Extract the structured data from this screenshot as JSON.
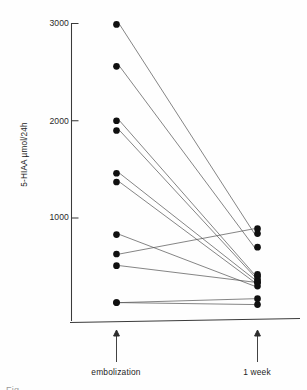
{
  "figure": {
    "kind": "paired-slope-scatter",
    "caption_fragment": "Fig."
  },
  "axes": {
    "y_title": "5-HIAA µmol/24h",
    "y_ticks": [
      {
        "label": "3000",
        "value": 3000
      },
      {
        "label": "2000",
        "value": 2000
      },
      {
        "label": "1000",
        "value": 1000
      }
    ],
    "categories": [
      {
        "label": "embolization",
        "arrow": "arrow-up-icon"
      },
      {
        "label": "1 week",
        "arrow": "arrow-up-icon"
      }
    ]
  },
  "chart_data": {
    "type": "line",
    "title": "",
    "subtitle": "",
    "xlabel": "",
    "ylabel": "5-HIAA µmol/24h",
    "categories": [
      "embolization",
      "1 week"
    ],
    "x": [
      0,
      1
    ],
    "ylim": [
      0,
      3050
    ],
    "xlim": [
      -0.18,
      1.18
    ],
    "yticks": [
      1000,
      2000,
      3000
    ],
    "grid": false,
    "legend": null,
    "marker": "filled-circle",
    "marker_color": "#111111",
    "line_color": "#4d4d4d",
    "n_pairs": 11,
    "series": [
      {
        "name": "patient-1",
        "values": [
          2990,
          840
        ]
      },
      {
        "name": "patient-2",
        "values": [
          2560,
          700
        ]
      },
      {
        "name": "patient-3",
        "values": [
          2000,
          420
        ]
      },
      {
        "name": "patient-4",
        "values": [
          1900,
          400
        ]
      },
      {
        "name": "patient-5",
        "values": [
          1460,
          370
        ]
      },
      {
        "name": "patient-6",
        "values": [
          1370,
          340
        ]
      },
      {
        "name": "patient-7",
        "values": [
          830,
          300
        ]
      },
      {
        "name": "patient-8",
        "values": [
          630,
          890
        ]
      },
      {
        "name": "patient-9",
        "values": [
          510,
          340
        ]
      },
      {
        "name": "patient-10",
        "values": [
          130,
          170
        ]
      },
      {
        "name": "patient-11",
        "values": [
          130,
          110
        ]
      }
    ]
  }
}
